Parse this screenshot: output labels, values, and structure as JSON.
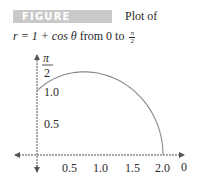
{
  "figure": {
    "label": "FIGURE 9.25a",
    "caption_line1": "Plot of",
    "caption_line2_prefix": "r = 1 + cos θ",
    "caption_from": " from 0 to ",
    "caption_frac_num": "π",
    "caption_frac_den": "2"
  },
  "axes": {
    "y_top_label_num": "π",
    "y_top_label_den": "2",
    "x_end_label": "0",
    "y_ticks": [
      "1.0",
      "0.5"
    ],
    "x_ticks": [
      "0.5",
      "1.0",
      "1.5",
      "2.0"
    ]
  },
  "colors": {
    "label_bg": "#c9c9c9",
    "curve": "#888888",
    "axis": "#555555"
  },
  "chart_data": {
    "type": "line",
    "equation": "r = 1 + cos(theta)",
    "theta_range": [
      0,
      1.5708
    ],
    "xlabel": "0 (polar axis)",
    "ylabel": "π/2",
    "x_ticks": [
      0.5,
      1.0,
      1.5,
      2.0
    ],
    "y_ticks": [
      0.5,
      1.0
    ],
    "xlim": [
      -0.35,
      2.3
    ],
    "ylim": [
      -0.3,
      1.6
    ],
    "grid": false,
    "series": [
      {
        "name": "r = 1 + cos θ",
        "x": [
          2.0,
          1.94,
          1.75,
          1.46,
          1.12,
          0.77,
          0.5,
          0.25,
          0.0
        ],
        "y": [
          0.0,
          0.38,
          0.73,
          1.01,
          1.21,
          1.3,
          1.3,
          1.21,
          1.0
        ]
      }
    ]
  }
}
